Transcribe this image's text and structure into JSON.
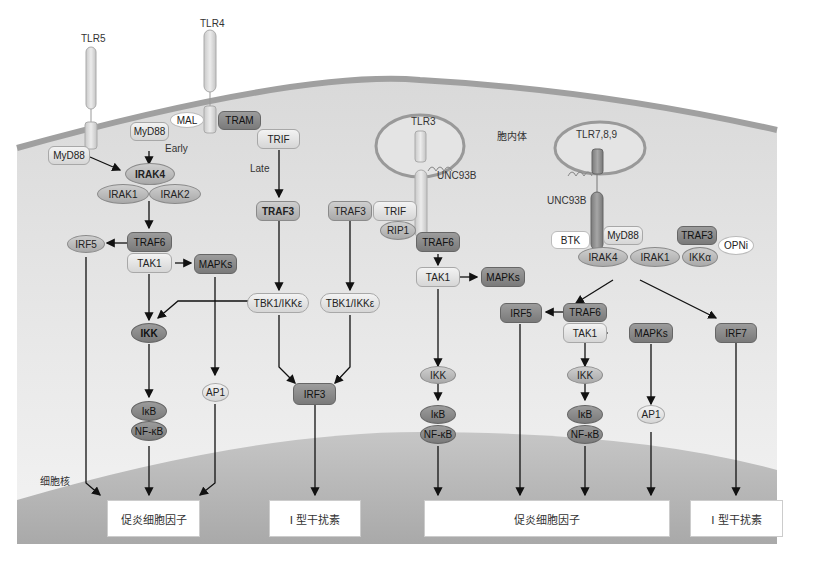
{
  "regions": {
    "endosome": "胞内体",
    "nucleus": "细胞核"
  },
  "receptors": {
    "tlr5": "TLR5",
    "tlr4": "TLR4",
    "tlr3": "TLR3",
    "tlr789": "TLR7,8,9"
  },
  "pathway_tlr5": {
    "myd88": "MyD88",
    "irak4": "IRAK4",
    "irak1": "IRAK1",
    "irak2": "IRAK2",
    "irf5": "IRF5",
    "traf6": "TRAF6",
    "tak1": "TAK1",
    "mapks": "MAPKs",
    "ikk": "IKK",
    "ap1": "AP1",
    "ikb": "IκB",
    "nfkb": "NF-κB"
  },
  "pathway_tlr4": {
    "mal": "MAL",
    "tram": "TRAM",
    "myd88": "MyD88",
    "early": "Early",
    "trif": "TRIF",
    "late": "Late",
    "traf3": "TRAF3",
    "tbk1": "TBK1/IKKε",
    "irf3": "IRF3"
  },
  "pathway_tlr3": {
    "unc93b": "UNC93B",
    "traf3": "TRAF3",
    "trif": "TRIF",
    "rip1": "RIP1",
    "tbk1": "TBK1/IKKε",
    "traf6": "TRAF6",
    "tak1": "TAK1",
    "mapks": "MAPKs",
    "ikk": "IKK",
    "ikb": "IκB",
    "nfkb": "NF-κB"
  },
  "pathway_tlr789": {
    "unc93b": "UNC93B",
    "btk": "BTK",
    "myd88": "MyD88",
    "traf3": "TRAF3",
    "irak4": "IRAK4",
    "irak1": "IRAK1",
    "ikka": "IKKα",
    "opni": "OPNi",
    "irf5": "IRF5",
    "traf6": "TRAF6",
    "tak1": "TAK1",
    "mapks": "MAPKs",
    "irf7": "IRF7",
    "ikk": "IKK",
    "ap1": "AP1",
    "ikb": "IκB",
    "nfkb": "NF-κB"
  },
  "outputs": [
    {
      "label": "促炎细胞因子"
    },
    {
      "label": "I 型干扰素"
    },
    {
      "label": "促炎细胞因子"
    },
    {
      "label": "I 型干扰素"
    }
  ],
  "colors": {
    "cytoplasm": "#e3e3e3",
    "membrane": "#a0a0a0",
    "nucleus": "#b4b4b4",
    "arrow": "#111111"
  }
}
